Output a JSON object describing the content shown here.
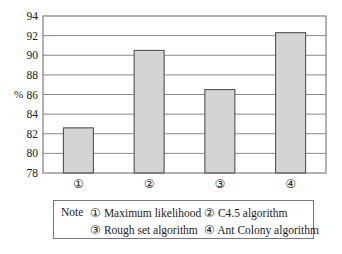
{
  "chart_data": {
    "type": "bar",
    "title": "",
    "xlabel": "",
    "ylabel": "%",
    "ylim": [
      78,
      94
    ],
    "yticks": [
      78,
      80,
      82,
      84,
      86,
      88,
      90,
      92,
      94
    ],
    "grid": true,
    "categories": [
      "①",
      "②",
      "③",
      "④"
    ],
    "values": [
      82.6,
      90.5,
      86.5,
      92.3
    ],
    "category_names": [
      "Maximum likelihood",
      "C4.5 algorithm",
      "Rough set algorithm",
      "Ant Colony algorithm"
    ],
    "legend_position": "bottom",
    "colors": {
      "bar_fill": "#d4d4d4",
      "bar_stroke": "#444444",
      "grid": "#8a8a8a",
      "axis": "#555555"
    }
  },
  "legend": {
    "note_label": "Note",
    "items": [
      {
        "marker": "①",
        "label": "Maximum likelihood"
      },
      {
        "marker": "②",
        "label": "C4.5 algorithm"
      },
      {
        "marker": "③",
        "label": "Rough set algorithm"
      },
      {
        "marker": "④",
        "label": "Ant Colony algorithm"
      }
    ]
  }
}
